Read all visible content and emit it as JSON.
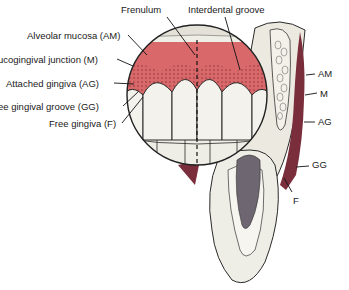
{
  "diagram": {
    "colors": {
      "gingiva": "#d9686a",
      "gingiva_dark": "#b84a4f",
      "mucosa_section": "#7a2d3a",
      "tooth": "#efeee6",
      "outline": "#2a2a2a",
      "pulp": "#6e6670"
    },
    "labels_left": [
      {
        "text": "Alveolar mucosa (AM)",
        "x": 27,
        "y": 31
      },
      {
        "text": "ucogingival junction (M)",
        "x": 0,
        "y": 55
      },
      {
        "text": "Attached gingiva (AG)",
        "x": 6,
        "y": 79
      },
      {
        "text": "ee gingival groove (GG)",
        "x": 0,
        "y": 102
      },
      {
        "text": "Free gingiva (F)",
        "x": 49,
        "y": 119
      }
    ],
    "labels_top": [
      {
        "text": "Frenulum",
        "x": 121,
        "y": 5
      },
      {
        "text": "Interdental groove",
        "x": 188,
        "y": 5
      }
    ],
    "labels_right": [
      {
        "text": "AM",
        "x": 318,
        "y": 69
      },
      {
        "text": "M",
        "x": 320,
        "y": 89
      },
      {
        "text": "AG",
        "x": 318,
        "y": 117
      },
      {
        "text": "GG",
        "x": 312,
        "y": 160
      },
      {
        "text": "F",
        "x": 293,
        "y": 196
      }
    ]
  }
}
